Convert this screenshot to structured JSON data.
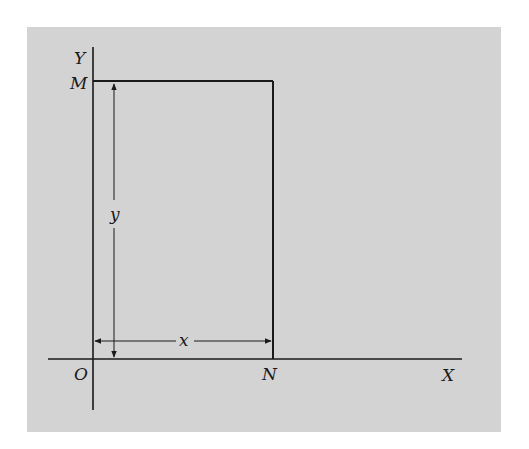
{
  "diagram": {
    "type": "coordinate-rectangle",
    "background_color": "#d3d3d3",
    "line_color": "#1a1a1a",
    "axes": {
      "x_label": "X",
      "y_label": "Y",
      "origin_label": "O"
    },
    "points": {
      "M": "M",
      "N": "N"
    },
    "dimensions": {
      "width_label": "x",
      "height_label": "y"
    }
  }
}
